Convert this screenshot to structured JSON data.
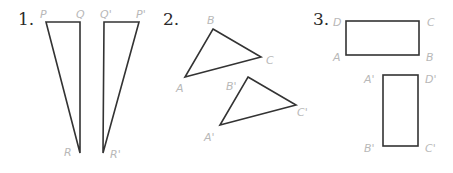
{
  "problems": [
    {
      "number": "1.",
      "figures": [
        {
          "type": "triangle",
          "vertices": [
            {
              "label": "P",
              "x": 46,
              "y": 22
            },
            {
              "label": "Q",
              "x": 80,
              "y": 22
            },
            {
              "label": "R",
              "x": 80,
              "y": 153
            }
          ]
        },
        {
          "type": "triangle",
          "vertices": [
            {
              "label": "Q'",
              "x": 104,
              "y": 22
            },
            {
              "label": "P'",
              "x": 139,
              "y": 22
            },
            {
              "label": "R'",
              "x": 103,
              "y": 153
            }
          ]
        }
      ]
    },
    {
      "number": "2.",
      "figures": [
        {
          "type": "triangle",
          "vertices": [
            {
              "label": "B",
              "x": 213,
              "y": 29
            },
            {
              "label": "C",
              "x": 261,
              "y": 57
            },
            {
              "label": "A",
              "x": 185,
              "y": 77
            }
          ]
        },
        {
          "type": "triangle",
          "vertices": [
            {
              "label": "B'",
              "x": 248,
              "y": 77
            },
            {
              "label": "C'",
              "x": 296,
              "y": 105
            },
            {
              "label": "A'",
              "x": 220,
              "y": 125
            }
          ]
        }
      ]
    },
    {
      "number": "3.",
      "figures": [
        {
          "type": "rectangle",
          "vertices": [
            {
              "label": "D",
              "x": 346,
              "y": 21
            },
            {
              "label": "C",
              "x": 419,
              "y": 21
            },
            {
              "label": "B",
              "x": 419,
              "y": 55
            },
            {
              "label": "A",
              "x": 346,
              "y": 55
            }
          ]
        },
        {
          "type": "rectangle",
          "vertices": [
            {
              "label": "A'",
              "x": 383,
              "y": 75
            },
            {
              "label": "D'",
              "x": 418,
              "y": 75
            },
            {
              "label": "C'",
              "x": 418,
              "y": 146
            },
            {
              "label": "B'",
              "x": 383,
              "y": 146
            }
          ]
        }
      ]
    }
  ],
  "colors": {
    "stroke": "#333333",
    "label": "#b8b8b8",
    "number": "#2a2a2a"
  }
}
